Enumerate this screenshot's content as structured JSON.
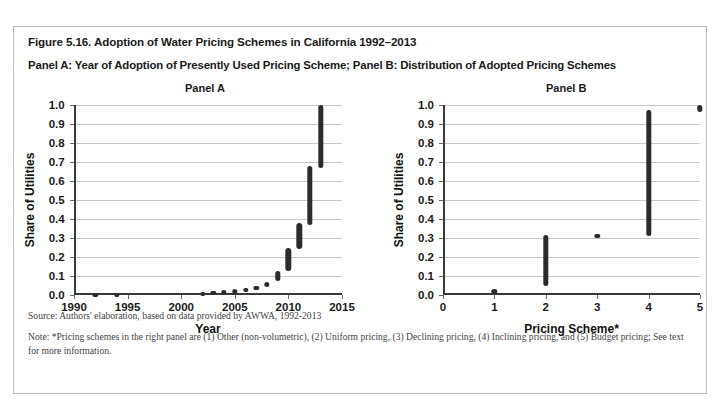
{
  "figure": {
    "title": "Figure 5.16. Adoption of Water Pricing Schemes in California 1992–2013",
    "subtitle": "Panel A: Year of Adoption of Presently Used Pricing Scheme; Panel B: Distribution of Adopted Pricing Schemes",
    "source": "Source: Authors' elaboration, based on data provided by AWWA, 1992-2013",
    "note": "Note: *Pricing schemes in the right panel are (1) Other (non-volumetric), (2) Uniform pricing, (3) Declining pricing, (4) Inclining pricing, and (5) Budget pricing; See text for more information.",
    "border_color": "#b9bcc0",
    "mark_color": "#2b2b2b",
    "grid_color": "#c5c7c9"
  },
  "chart_data": [
    {
      "type": "scatter",
      "panel_id": "A",
      "title": "Panel A",
      "xlabel": "Year",
      "ylabel": "Share of Utilities",
      "xlim": [
        1990,
        2015
      ],
      "ylim": [
        0.0,
        1.0
      ],
      "xticks": [
        1990,
        1995,
        2000,
        2005,
        2010,
        2015
      ],
      "xticklabels": [
        "1990",
        "1995",
        "2000",
        "2005",
        "2010",
        "2015"
      ],
      "yticks": [
        0.0,
        0.1,
        0.2,
        0.3,
        0.4,
        0.5,
        0.6,
        0.7,
        0.8,
        0.9,
        1.0
      ],
      "yticklabels": [
        "0.0",
        "0.1",
        "0.2",
        "0.3",
        "0.4",
        "0.5",
        "0.6",
        "0.7",
        "0.8",
        "0.9",
        "1.0"
      ],
      "grid": "horizontal",
      "legend": "none",
      "marks": [
        {
          "x": 1992,
          "y_low": 0.005,
          "y_high": 0.012
        },
        {
          "x": 1994,
          "y_low": 0.006,
          "y_high": 0.013
        },
        {
          "x": 2002,
          "y_low": 0.009,
          "y_high": 0.018
        },
        {
          "x": 2003,
          "y_low": 0.012,
          "y_high": 0.022
        },
        {
          "x": 2004,
          "y_low": 0.014,
          "y_high": 0.026
        },
        {
          "x": 2005,
          "y_low": 0.018,
          "y_high": 0.031
        },
        {
          "x": 2006,
          "y_low": 0.022,
          "y_high": 0.038
        },
        {
          "x": 2007,
          "y_low": 0.03,
          "y_high": 0.048
        },
        {
          "x": 2008,
          "y_low": 0.042,
          "y_high": 0.068
        },
        {
          "x": 2009,
          "y_low": 0.075,
          "y_high": 0.125
        },
        {
          "x": 2010,
          "y_low": 0.125,
          "y_high": 0.248
        },
        {
          "x": 2011,
          "y_low": 0.24,
          "y_high": 0.378
        },
        {
          "x": 2012,
          "y_low": 0.37,
          "y_high": 0.68
        },
        {
          "x": 2013,
          "y_low": 0.67,
          "y_high": 1.0
        }
      ]
    },
    {
      "type": "scatter",
      "panel_id": "B",
      "title": "Panel B",
      "xlabel": "Pricing Scheme*",
      "ylabel": "Share of Utilities",
      "xlim": [
        0,
        5
      ],
      "ylim": [
        0.0,
        1.0
      ],
      "xticks": [
        0,
        1,
        2,
        3,
        4,
        5
      ],
      "xticklabels": [
        "0",
        "1",
        "2",
        "3",
        "4",
        "5"
      ],
      "yticks": [
        0.0,
        0.1,
        0.2,
        0.3,
        0.4,
        0.5,
        0.6,
        0.7,
        0.8,
        0.9,
        1.0
      ],
      "yticklabels": [
        "0.0",
        "0.1",
        "0.2",
        "0.3",
        "0.4",
        "0.5",
        "0.6",
        "0.7",
        "0.8",
        "0.9",
        "1.0"
      ],
      "grid": "horizontal",
      "legend": "none",
      "scheme_names": [
        "Other (non-volumetric)",
        "Uniform pricing",
        "Declining pricing",
        "Inclining pricing",
        "Budget pricing"
      ],
      "marks": [
        {
          "x": 1,
          "y_low": 0.018,
          "y_high": 0.03
        },
        {
          "x": 2,
          "y_low": 0.048,
          "y_high": 0.315
        },
        {
          "x": 3,
          "y_low": 0.308,
          "y_high": 0.322
        },
        {
          "x": 4,
          "y_low": 0.312,
          "y_high": 0.972
        },
        {
          "x": 5,
          "y_low": 0.965,
          "y_high": 1.0
        }
      ]
    }
  ]
}
